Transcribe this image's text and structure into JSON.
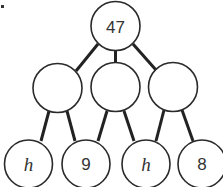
{
  "diagram": {
    "type": "number-pyramid",
    "marker": "•",
    "top": {
      "value": "47"
    },
    "middle": [
      {
        "value": ""
      },
      {
        "value": ""
      },
      {
        "value": ""
      }
    ],
    "bottom": [
      {
        "value": "h",
        "is_variable": true
      },
      {
        "value": "9",
        "is_variable": false
      },
      {
        "value": "h",
        "is_variable": true
      },
      {
        "value": "8",
        "is_variable": false
      }
    ],
    "colors": {
      "stroke": "#2a2a2a",
      "edge": "#222222",
      "text": "#333333",
      "background": "#ffffff"
    }
  }
}
